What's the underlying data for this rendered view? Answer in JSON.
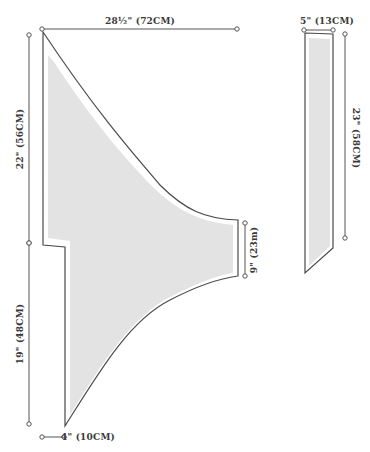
{
  "colors": {
    "outline": "#4a4a4a",
    "fill": "#e3e3e3",
    "measure": "#555555",
    "text": "#3a3a3a"
  },
  "pieces": [
    {
      "name": "main-body-piece",
      "outline": "M43,32 L43,245 L65,247 L65,426 C100,370 130,320 170,300 C195,287 215,279 238,276 L238,220 C205,219 185,210 160,185 C130,150 95,110 43,32 Z",
      "fill": "M48,55 L48,238 L70,241 L70,415 C104,360 133,315 172,296 C196,284 214,276 233,273 L233,225 C203,222 181,213 156,190 C124,158 92,120 54,62 Z"
    },
    {
      "name": "strip-piece",
      "outline": "M305,33 L333,34 L333,248 L305,273 Z",
      "fill": "M309,38 L330,39 L330,246 L309,266 Z"
    }
  ],
  "measurements": [
    {
      "name": "top-width-measure",
      "x1": 42,
      "y1": 29,
      "x2": 237,
      "y2": 29,
      "label": "28½\" (72CM)",
      "lx": 140,
      "ly": 21,
      "rot": "center"
    },
    {
      "name": "upper-left-height-measure",
      "x1": 29,
      "y1": 35,
      "x2": 29,
      "y2": 243,
      "label": "22\" (56CM)",
      "lx": 20,
      "ly": 139,
      "rot": "rot-ccw"
    },
    {
      "name": "lower-left-height-measure",
      "x1": 29,
      "y1": 243,
      "x2": 29,
      "y2": 424,
      "label": "19\" (48CM)",
      "lx": 20,
      "ly": 334,
      "rot": "rot-ccw"
    },
    {
      "name": "bottom-width-measure",
      "x1": 42,
      "y1": 437,
      "x2": 64,
      "y2": 437,
      "label": "4\" (10CM)",
      "lx": 88,
      "ly": 437,
      "rot": "center"
    },
    {
      "name": "right-end-height-measure",
      "x1": 245,
      "y1": 223,
      "x2": 245,
      "y2": 276,
      "label": "9\" (23m)",
      "lx": 254,
      "ly": 250,
      "rot": "rot-ccw"
    },
    {
      "name": "strip-width-measure",
      "x1": 304,
      "y1": 30,
      "x2": 333,
      "y2": 30,
      "label": "5\" (13CM)",
      "lx": 327,
      "ly": 21,
      "rot": "center"
    },
    {
      "name": "strip-height-measure",
      "x1": 345,
      "y1": 34,
      "x2": 345,
      "y2": 238,
      "label": "23\" (58CM)",
      "lx": 356,
      "ly": 138,
      "rot": "rot-cw"
    }
  ]
}
